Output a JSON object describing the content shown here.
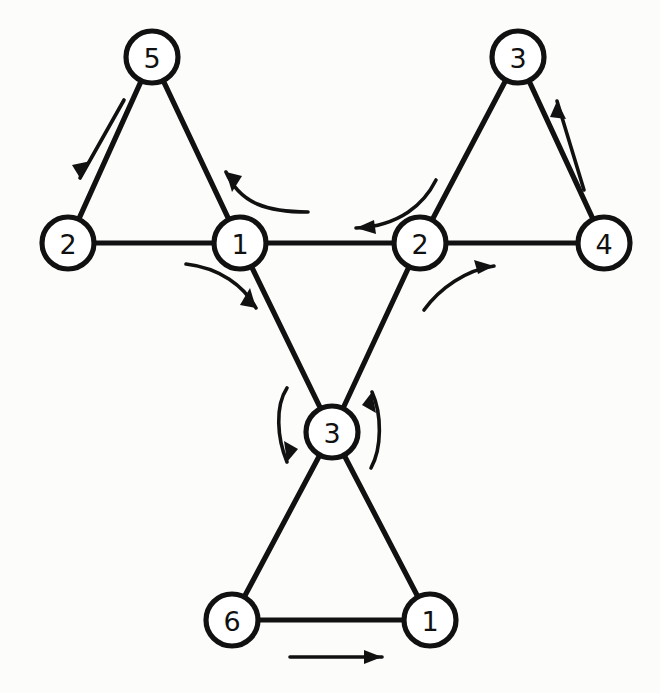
{
  "diagram": {
    "title": "Node-link graph of three triangles joined by a central chain",
    "background_color": "#fcfcfb",
    "stroke_color": "#111111",
    "node_fill_color": "#ffffff",
    "node_radius": 26,
    "nodes": [
      {
        "id": "n5",
        "label": "5",
        "x": 152,
        "y": 57,
        "group": "top-left-triangle"
      },
      {
        "id": "n2left",
        "label": "2",
        "x": 68,
        "y": 243,
        "group": "top-left-triangle"
      },
      {
        "id": "n1hub",
        "label": "1",
        "x": 240,
        "y": 243,
        "group": "center-hub"
      },
      {
        "id": "n3top",
        "label": "3",
        "x": 518,
        "y": 57,
        "group": "top-right-triangle"
      },
      {
        "id": "n2hub",
        "label": "2",
        "x": 420,
        "y": 243,
        "group": "center-hub"
      },
      {
        "id": "n4right",
        "label": "4",
        "x": 604,
        "y": 243,
        "group": "top-right-triangle"
      },
      {
        "id": "n3hub",
        "label": "3",
        "x": 332,
        "y": 432,
        "group": "center-hub"
      },
      {
        "id": "n6",
        "label": "6",
        "x": 232,
        "y": 620,
        "group": "bottom-triangle"
      },
      {
        "id": "n1bot",
        "label": "1",
        "x": 430,
        "y": 620,
        "group": "bottom-triangle"
      }
    ],
    "edges": [
      {
        "id": "e-5-2",
        "from": "n5",
        "to": "n2left",
        "name": "edge-5-to-2-left"
      },
      {
        "id": "e-5-1",
        "from": "n5",
        "to": "n1hub",
        "name": "edge-5-to-1-hub"
      },
      {
        "id": "e-2-1",
        "from": "n2left",
        "to": "n1hub",
        "name": "edge-2-left-to-1-hub"
      },
      {
        "id": "e-1-2",
        "from": "n1hub",
        "to": "n2hub",
        "name": "edge-1-hub-to-2-hub"
      },
      {
        "id": "e-3-2",
        "from": "n3top",
        "to": "n2hub",
        "name": "edge-3-top-to-2-hub"
      },
      {
        "id": "e-3-4",
        "from": "n3top",
        "to": "n4right",
        "name": "edge-3-top-to-4"
      },
      {
        "id": "e-2-4",
        "from": "n2hub",
        "to": "n4right",
        "name": "edge-2-hub-to-4"
      },
      {
        "id": "e-1-3",
        "from": "n1hub",
        "to": "n3hub",
        "name": "edge-1-hub-to-3-hub"
      },
      {
        "id": "e-2-3",
        "from": "n2hub",
        "to": "n3hub",
        "name": "edge-2-hub-to-3-hub"
      },
      {
        "id": "e-3-6",
        "from": "n3hub",
        "to": "n6",
        "name": "edge-3-hub-to-6"
      },
      {
        "id": "e-3-1b",
        "from": "n3hub",
        "to": "n1bot",
        "name": "edge-3-hub-to-1-bottom"
      },
      {
        "id": "e-6-1",
        "from": "n6",
        "to": "n1bot",
        "name": "edge-6-to-1-bottom"
      }
    ],
    "flow_arrows": [
      {
        "id": "a-5-2",
        "name": "flow-arrow-5-to-2-downleft",
        "type": "straight",
        "direction": "down-left",
        "path": "M 124 100 L 80 178",
        "head": "M 80 178 L 91 161 L 72 165 Z",
        "description": "straight arrow alongside edge 5-2 pointing down-left"
      },
      {
        "id": "a-hub1-up",
        "name": "flow-arrow-1-hub-turn-up-left",
        "type": "curved",
        "direction": "up-left",
        "path": "M 308 212 C 268 212 240 204 226 172",
        "head": "M 226 172 L 232 192 L 242 176 Z",
        "description": "curve from horizontal edge turning up-left onto edge 5-1"
      },
      {
        "id": "a-hub1-down",
        "name": "flow-arrow-1-hub-turn-down-right",
        "type": "curved",
        "direction": "down-right",
        "path": "M 186 264 C 220 268 244 286 256 308",
        "head": "M 256 308 L 250 288 L 240 305 Z",
        "description": "curve from edge 2-1 turning down-right onto edge 1-3"
      },
      {
        "id": "a-hub2-left",
        "name": "flow-arrow-2-hub-turn-left",
        "type": "curved",
        "direction": "left",
        "path": "M 436 180 C 424 204 400 226 356 228",
        "head": "M 356 228 L 376 234 L 374 220 Z",
        "description": "curve from edge 3-2 turning left onto horizontal edge 2-1"
      },
      {
        "id": "a-hub2-right",
        "name": "flow-arrow-2-hub-turn-up-right",
        "type": "curved",
        "direction": "up-right",
        "path": "M 424 310 C 440 288 466 270 494 266",
        "head": "M 494 266 L 474 260 L 478 274 Z",
        "description": "curve from edge 2-3 turning up-right onto horizontal edge 2-4"
      },
      {
        "id": "a-3-4",
        "name": "flow-arrow-4-to-3-upright",
        "type": "straight",
        "direction": "up-right",
        "path": "M 584 190 L 557 101",
        "head": "M 557 101 L 566 119 L 550 117 Z",
        "description": "straight arrow alongside edge 3-4 pointing up toward node 3"
      },
      {
        "id": "a-hub3-left",
        "name": "flow-arrow-3-hub-down-left",
        "type": "curved",
        "direction": "down",
        "path": "M 287 388 C 275 406 277 438 287 462",
        "head": "M 287 462 L 284 441 L 298 449 Z",
        "description": "vertical curve left of node 3 pointing down"
      },
      {
        "id": "a-hub3-right",
        "name": "flow-arrow-3-hub-up-right",
        "type": "curved",
        "direction": "up",
        "path": "M 371 468 C 382 448 382 414 372 392",
        "head": "M 372 392 L 376 413 L 362 405 Z",
        "description": "vertical curve right of node 3 pointing up"
      },
      {
        "id": "a-6-1",
        "name": "flow-arrow-6-to-1-right",
        "type": "straight",
        "direction": "right",
        "path": "M 290 657 L 382 657",
        "head": "M 382 657 L 364 650 L 364 664 Z",
        "description": "straight horizontal arrow below edge 6-1 pointing right"
      }
    ]
  }
}
